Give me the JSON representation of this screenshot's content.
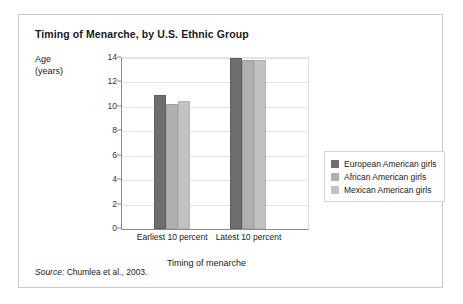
{
  "figure": {
    "title": "Timing of Menarche, by U.S. Ethnic Group",
    "source_word": "Source:",
    "source_text": " Chumlea et al., 2003."
  },
  "chart_data": {
    "type": "bar",
    "title": "Timing of Menarche, by U.S. Ethnic Group",
    "xlabel": "Timing of menarche",
    "ylabel": "Age (years)",
    "ylabel_line1": "Age",
    "ylabel_line2": "(years)",
    "categories": [
      "Earliest 10 percent",
      "Latest 10 percent"
    ],
    "series": [
      {
        "name": "European American girls",
        "color": "#6e6e6e",
        "values": [
          11.0,
          14.0
        ]
      },
      {
        "name": "African American girls",
        "color": "#b0b0b0",
        "values": [
          10.2,
          13.8
        ]
      },
      {
        "name": "Mexican American girls",
        "color": "#c2c2c2",
        "values": [
          10.5,
          13.8
        ]
      }
    ],
    "ylim": [
      0,
      14
    ],
    "yticks": [
      0,
      2,
      4,
      6,
      8,
      10,
      12,
      14
    ],
    "ytick_labels": [
      "0",
      "2",
      "4",
      "6",
      "8",
      "10",
      "12",
      "14"
    ],
    "grid": true,
    "legend_position": "right"
  }
}
